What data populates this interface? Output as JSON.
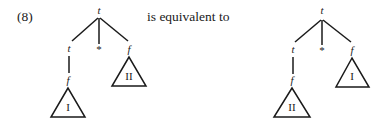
{
  "equation_number": "(8)",
  "connector_text": "is equivalent to",
  "trees": [
    {
      "name": "left-tree",
      "root": "t",
      "children": [
        {
          "label": "t",
          "child": {
            "label": "f",
            "subtree": "I"
          }
        },
        {
          "label": "*"
        },
        {
          "label": "f",
          "subtree": "II"
        }
      ]
    },
    {
      "name": "right-tree",
      "root": "t",
      "children": [
        {
          "label": "t",
          "child": {
            "label": "f",
            "subtree": "II"
          }
        },
        {
          "label": "*"
        },
        {
          "label": "f",
          "subtree": "I"
        }
      ]
    }
  ]
}
